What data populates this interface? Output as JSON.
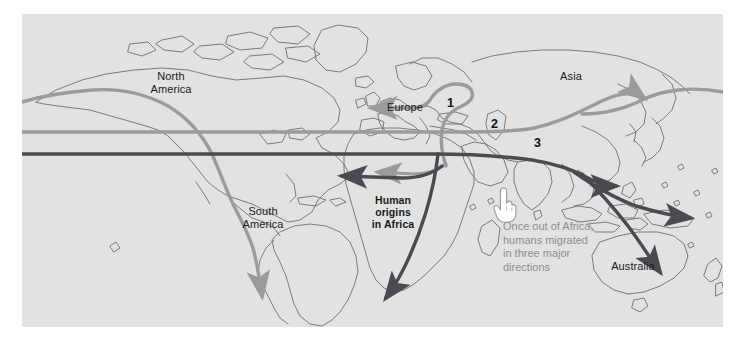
{
  "figure": {
    "type": "map",
    "background_color": "#e2e2e2",
    "border_color": "#ffffff",
    "coastline_color": "#6e6e6e"
  },
  "continent_labels": [
    {
      "id": "north-america",
      "text": "North\nAmerica",
      "x": 148,
      "y": 72,
      "bold": false
    },
    {
      "id": "south-america",
      "text": "South\nAmerica",
      "x": 240,
      "y": 207,
      "bold": false
    },
    {
      "id": "europe",
      "text": "Europe",
      "x": 383,
      "y": 93,
      "bold": false
    },
    {
      "id": "asia",
      "text": "Asia",
      "x": 549,
      "y": 62,
      "bold": false
    },
    {
      "id": "australia",
      "text": "Australia",
      "x": 611,
      "y": 252,
      "bold": false
    },
    {
      "id": "human-origins",
      "text": "Human\norigins\nin Africa",
      "x": 371,
      "y": 196,
      "bold": true
    }
  ],
  "route_numbers": [
    {
      "id": "route-1",
      "label": "1",
      "x": 451,
      "y": 89,
      "color": "#8f8f8f"
    },
    {
      "id": "route-2",
      "label": "2",
      "x": 495,
      "y": 110,
      "color": "#8f8f8f"
    },
    {
      "id": "route-3",
      "label": "3",
      "x": 538,
      "y": 130,
      "color": "#4a4a52"
    }
  ],
  "annotation": {
    "id": "migration-note",
    "lines": [
      "Once out of Africa,",
      "humans migrated",
      "in three major",
      "directions"
    ],
    "text": "Once out of Africa,\nhumans migrated\nin three major\ndirections",
    "color": "#8f8f8f",
    "x": 503,
    "y": 219
  },
  "icons": {
    "pointing_hand": {
      "name": "pointing-hand-icon",
      "x": 492,
      "y": 188,
      "fill": "#ffffff",
      "stroke": "#9a9a9a"
    }
  },
  "routes": [
    {
      "id": "route-1-europe",
      "number": "1",
      "destination": "Europe",
      "color": "#9b9b9b",
      "description": "Northwest out of the Levant into Europe"
    },
    {
      "id": "route-2-northeast-asia",
      "number": "2",
      "destination": "Northeast Asia",
      "color": "#9b9b9b",
      "description": "East across central Asia to northeast Asia"
    },
    {
      "id": "route-3-southeast-asia-australia",
      "number": "3",
      "destination": "Southeast Asia and Australia",
      "color": "#4a4a52",
      "description": "Along the southern coast of Asia to Australia and Melanesia"
    },
    {
      "id": "route-americas",
      "number": "",
      "destination": "The Americas",
      "color": "#9b9b9b",
      "description": "Across Beringia down the Pacific coast to southern South America"
    },
    {
      "id": "route-west-africa",
      "number": "",
      "destination": "West Africa",
      "color": "#4a4a52",
      "description": "Westward across northern Africa"
    },
    {
      "id": "route-southern-africa",
      "number": "",
      "destination": "Southern Africa",
      "color": "#4a4a52",
      "description": "Southward down the length of Africa"
    }
  ]
}
